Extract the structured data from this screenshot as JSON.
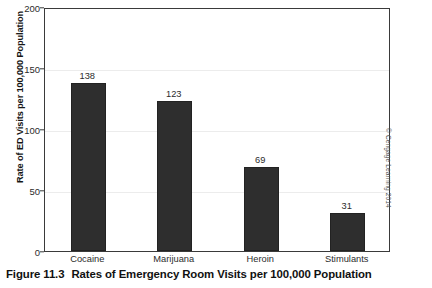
{
  "caption": {
    "number": "Figure 11.3",
    "title": "Rates of Emergency Room Visits per 100,000 Population"
  },
  "credit": "© Cengage Learning 2014",
  "chart_data": {
    "type": "bar",
    "title": "",
    "xlabel": "",
    "ylabel": "Rate of ED Visits per 100,000 Population",
    "categories": [
      "Cocaine",
      "Marijuana",
      "Heroin",
      "Stimulants"
    ],
    "values": [
      138,
      123,
      69,
      31
    ],
    "value_labels": [
      "138",
      "123",
      "69",
      "31"
    ],
    "ylim": [
      0,
      200
    ],
    "yticks": [
      0,
      50,
      100,
      150,
      200
    ],
    "ytick_labels": [
      "0",
      "50",
      "100",
      "150",
      "200"
    ],
    "grid": true,
    "legend": false,
    "bar_color": "#2e2e2e",
    "axis_color": "#3a3a3a",
    "background": "#ffffff"
  }
}
